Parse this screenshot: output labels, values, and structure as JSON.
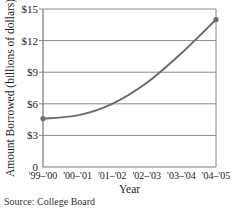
{
  "chart_data": {
    "type": "line",
    "title": "",
    "xlabel": "Year",
    "ylabel": "Amount Borrowed (billions of dollars)",
    "categories": [
      "'99–'00",
      "'00–'01",
      "'01–'02",
      "'02–'03",
      "'03–'04",
      "'04–'05"
    ],
    "series": [
      {
        "name": "Amount Borrowed",
        "values": [
          4.6,
          4.9,
          6.0,
          8.0,
          10.8,
          14.0
        ]
      }
    ],
    "yticks": [
      "0",
      "$3",
      "$6",
      "$9",
      "$12",
      "$15"
    ],
    "ytick_values": [
      0,
      3,
      6,
      9,
      12,
      15
    ],
    "ylim": [
      0,
      15
    ],
    "grid": {
      "horizontal": true,
      "vertical": false
    },
    "endpoint_markers": true,
    "line_color": "#6b6b6b",
    "grid_color": "#8a8a8a",
    "source": "Source: College Board"
  }
}
